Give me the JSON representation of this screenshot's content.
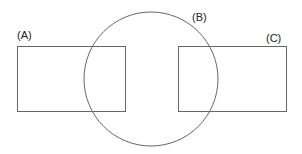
{
  "diagram": {
    "type": "shapes-overlap",
    "stroke_color": "#666666",
    "background": "#ffffff",
    "shapes": [
      {
        "id": "A",
        "label": "(A)",
        "kind": "rectangle",
        "x": 17,
        "y": 46,
        "width": 108,
        "height": 65
      },
      {
        "id": "B",
        "label": "(B)",
        "kind": "circle",
        "cx": 151,
        "cy": 79,
        "r": 67
      },
      {
        "id": "C",
        "label": "(C)",
        "kind": "rectangle",
        "x": 178,
        "y": 46,
        "width": 108,
        "height": 65
      }
    ]
  }
}
